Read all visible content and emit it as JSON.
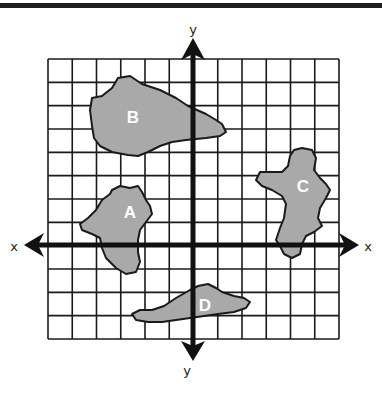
{
  "diagram": {
    "type": "coordinate-grid",
    "grid": {
      "columns": 12,
      "rows": 12,
      "left": 48,
      "top": 59,
      "right": 339,
      "bottom": 339
    },
    "axes": {
      "x_label_left": "x",
      "x_label_right": "x",
      "y_label_top": "y",
      "y_label_bottom": "y"
    },
    "shapes": [
      {
        "label": "A",
        "fill": "#a9a9a9",
        "quadrant": "II/III"
      },
      {
        "label": "B",
        "fill": "#a9a9a9",
        "quadrant": "II"
      },
      {
        "label": "C",
        "fill": "#a9a9a9",
        "quadrant": "I/IV"
      },
      {
        "label": "D",
        "fill": "#a9a9a9",
        "quadrant": "III/IV"
      }
    ],
    "colors": {
      "line": "#1a1a1a",
      "shape_fill": "#a9a9a9",
      "label_text": "#ffffff",
      "background": "#ffffff"
    }
  }
}
